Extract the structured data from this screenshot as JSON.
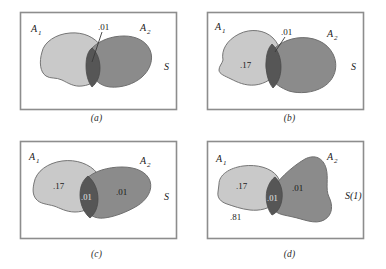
{
  "figure": {
    "type": "venn-diagram-grid",
    "rows": 2,
    "columns": 2,
    "colors": {
      "background": "#ffffff",
      "frame": "#8d8d8d",
      "set_a1_fill": "#c9c9c9",
      "set_a2_fill": "#8b8b8b",
      "intersection_fill": "#565656",
      "outline": "#6f6f6f",
      "text": "#1a1a1a"
    },
    "panels": [
      {
        "id": "a",
        "caption": "(a)",
        "sample_space_label": "S",
        "set_labels": {
          "a1": "A",
          "a1_sub": "1",
          "a2": "A",
          "a2_sub": "2"
        },
        "probabilities": [
          {
            "name": "intersection",
            "value": ".01",
            "has_leader_line": true
          }
        ]
      },
      {
        "id": "b",
        "caption": "(b)",
        "sample_space_label": "S",
        "set_labels": {
          "a1": "A",
          "a1_sub": "1",
          "a2": "A",
          "a2_sub": "2"
        },
        "probabilities": [
          {
            "name": "a1-only",
            "value": ".17",
            "has_leader_line": false
          },
          {
            "name": "intersection",
            "value": ".01",
            "has_leader_line": true
          }
        ]
      },
      {
        "id": "c",
        "caption": "(c)",
        "sample_space_label": "S",
        "set_labels": {
          "a1": "A",
          "a1_sub": "1",
          "a2": "A",
          "a2_sub": "2"
        },
        "probabilities": [
          {
            "name": "a1-only",
            "value": ".17",
            "has_leader_line": false
          },
          {
            "name": "intersection",
            "value": ".01",
            "has_leader_line": false
          },
          {
            "name": "a2-only",
            "value": ".01",
            "has_leader_line": false
          }
        ]
      },
      {
        "id": "d",
        "caption": "(d)",
        "sample_space_label": "S(1)",
        "set_labels": {
          "a1": "A",
          "a1_sub": "1",
          "a2": "A",
          "a2_sub": "2"
        },
        "probabilities": [
          {
            "name": "a1-only",
            "value": ".17",
            "has_leader_line": false
          },
          {
            "name": "intersection",
            "value": ".01",
            "has_leader_line": false
          },
          {
            "name": "a2-only",
            "value": ".01",
            "has_leader_line": false
          },
          {
            "name": "outside",
            "value": ".81",
            "has_leader_line": false
          }
        ]
      }
    ]
  }
}
